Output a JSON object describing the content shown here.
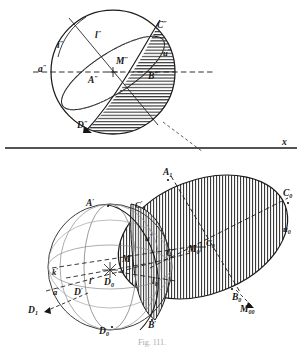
{
  "figure": {
    "caption": "Fig. 111.",
    "ground_line_label": "x",
    "plate_title": "Sphere cut by a plane — vertical projection and oblique construction"
  },
  "upper_view": {
    "name": "vertical-projection-sphere",
    "labels": [
      {
        "id": "i2",
        "text": "i",
        "prime": "\"",
        "x": 57,
        "y": 45,
        "size": "lbl-m"
      },
      {
        "id": "l2",
        "text": "l",
        "prime": "\"",
        "x": 95,
        "y": 35,
        "size": "lbl-m"
      },
      {
        "id": "C2",
        "text": "C",
        "prime": "\"",
        "x": 159,
        "y": 25,
        "size": "lbl-m"
      },
      {
        "id": "a2",
        "text": "a",
        "prime": "\"",
        "x": 41,
        "y": 70,
        "size": "lbl-m"
      },
      {
        "id": "A2",
        "text": "A",
        "prime": "\"",
        "x": 90,
        "y": 80,
        "size": "lbl-m"
      },
      {
        "id": "M2",
        "text": "M",
        "prime": "\"",
        "x": 119,
        "y": 65,
        "size": "lbl-m"
      },
      {
        "id": "u2",
        "text": "u",
        "prime": "\"",
        "x": 166,
        "y": 53,
        "size": "lbl-s"
      },
      {
        "id": "B2",
        "text": "B",
        "prime": "\"",
        "x": 150,
        "y": 75,
        "size": "lbl-m"
      },
      {
        "id": "D2",
        "text": "D",
        "prime": "\"",
        "x": 80,
        "y": 123,
        "size": "lbl-m"
      }
    ]
  },
  "lower_view": {
    "name": "oblique-construction",
    "labels": [
      {
        "id": "A0",
        "text": "A",
        "prime": "",
        "sub": "1",
        "x": 166,
        "y": 172,
        "size": "lbl-m"
      },
      {
        "id": "C1p",
        "text": "C",
        "prime": "'",
        "sub": "1",
        "x": 138,
        "y": 205,
        "size": "lbl-s"
      },
      {
        "id": "Ap",
        "text": "A",
        "prime": "'",
        "sub": "",
        "x": 90,
        "y": 203,
        "size": "lbl-m"
      },
      {
        "id": "C0",
        "text": "C",
        "prime": "",
        "sub": "0",
        "x": 286,
        "y": 193,
        "size": "lbl-m"
      },
      {
        "id": "u0",
        "text": "u",
        "prime": "",
        "sub": "0",
        "x": 286,
        "y": 229,
        "size": "lbl-s"
      },
      {
        "id": "up",
        "text": "u",
        "prime": "'",
        "sub": "",
        "x": 148,
        "y": 238,
        "size": "lbl-s"
      },
      {
        "id": "M0",
        "text": "M",
        "prime": "",
        "sub": "0",
        "x": 192,
        "y": 249,
        "size": "lbl-m"
      },
      {
        "id": "C0b",
        "text": "C",
        "prime": "",
        "sub": "0",
        "x": 208,
        "y": 244,
        "size": "lbl-s"
      },
      {
        "id": "Cp",
        "text": "C",
        "prime": "'",
        "sub": "",
        "x": 170,
        "y": 253,
        "size": "lbl-m"
      },
      {
        "id": "Mp",
        "text": "M",
        "prime": "'",
        "sub": "",
        "x": 126,
        "y": 259,
        "size": "lbl-m"
      },
      {
        "id": "kp",
        "text": "k",
        "prime": "'",
        "sub": "",
        "x": 55,
        "y": 272,
        "size": "lbl-s"
      },
      {
        "id": "lp",
        "text": "l",
        "prime": "'",
        "sub": "",
        "x": 92,
        "y": 281,
        "size": "lbl-s"
      },
      {
        "id": "D0c",
        "text": "D",
        "prime": "",
        "sub": "0",
        "x": 108,
        "y": 282,
        "size": "lbl-m"
      },
      {
        "id": "l0",
        "text": "l",
        "prime": "",
        "sub": "0",
        "x": 155,
        "y": 281,
        "size": "lbl-m"
      },
      {
        "id": "ap",
        "text": "a",
        "prime": "'",
        "sub": "",
        "x": 56,
        "y": 292,
        "size": "lbl-s"
      },
      {
        "id": "Dp",
        "text": "D",
        "prime": "'",
        "sub": "",
        "x": 78,
        "y": 292,
        "size": "lbl-m"
      },
      {
        "id": "D1",
        "text": "D",
        "prime": "",
        "sub": "1",
        "x": 33,
        "y": 310,
        "size": "lbl-m"
      },
      {
        "id": "B0",
        "text": "B",
        "prime": "",
        "sub": "0",
        "x": 236,
        "y": 297,
        "size": "lbl-m"
      },
      {
        "id": "M00",
        "text": "M",
        "prime": "",
        "sub": "00",
        "x": 244,
        "y": 309,
        "size": "lbl-m"
      },
      {
        "id": "D0b",
        "text": "D",
        "prime": "",
        "sub": "0",
        "x": 103,
        "y": 331,
        "size": "lbl-m"
      },
      {
        "id": "Bp",
        "text": "B",
        "prime": "'",
        "sub": "",
        "x": 152,
        "y": 325,
        "size": "lbl-m"
      }
    ]
  },
  "colors": {
    "ink": "#151515",
    "paper": "#ffffff",
    "hatch": "#2a2a2a",
    "faint": "#6f6f6f"
  }
}
